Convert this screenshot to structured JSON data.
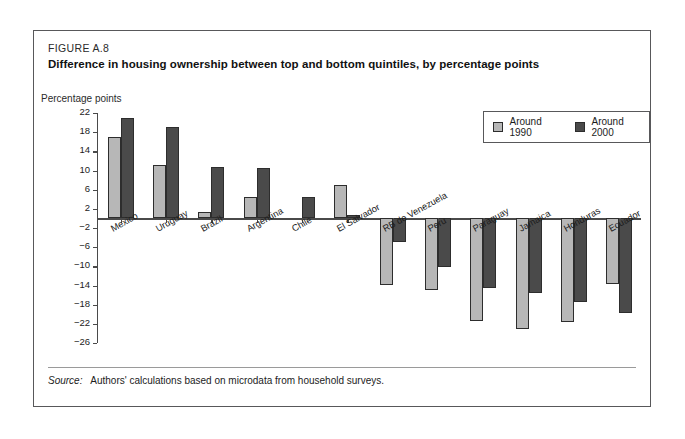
{
  "figure": {
    "number": "FIGURE A.8",
    "title": "Difference in housing ownership between top and bottom quintiles, by percentage points",
    "axis_title": "Percentage points",
    "source_label": "Source:",
    "source_text": "Authors' calculations based on microdata from household surveys."
  },
  "legend": {
    "position": "top-right",
    "items": [
      {
        "label": "Around 1990",
        "color": "#b7b7b7"
      },
      {
        "label": "Around 2000",
        "color": "#4a4a4a"
      }
    ]
  },
  "chart_data": {
    "type": "bar",
    "title": "Difference in housing ownership between top and bottom quintiles, by percentage points",
    "xlabel": "",
    "ylabel": "Percentage points",
    "ylim": [
      -26,
      22
    ],
    "ytick_step": 4,
    "yticks": [
      22,
      18,
      14,
      10,
      6,
      2,
      -2,
      -6,
      -10,
      -14,
      -18,
      -22,
      -26
    ],
    "ytick_labels": [
      "22",
      "18",
      "14",
      "10",
      "6",
      "2",
      "−2",
      "−6",
      "−10",
      "−14",
      "−18",
      "−22",
      "−26"
    ],
    "grid": false,
    "legend_position": "top-right",
    "categories": [
      "Mexico",
      "Uruguay",
      "Brazil",
      "Argentina",
      "Chile",
      "El Salvador",
      "RB de Venezuela",
      "Peru",
      "Paraguay",
      "Jamaica",
      "Honduras",
      "Ecuador"
    ],
    "series": [
      {
        "name": "Around 1990",
        "color": "#b7b7b7",
        "values": [
          17,
          11.2,
          1.3,
          4.4,
          null,
          6.9,
          -14,
          -15,
          -21.5,
          -23,
          -21.7,
          -13.7
        ]
      },
      {
        "name": "Around 2000",
        "color": "#4a4a4a",
        "values": [
          20.9,
          19,
          10.8,
          10.6,
          4.4,
          0.7,
          -5,
          -10.2,
          -14.5,
          -15.5,
          -17.5,
          -19.7
        ]
      }
    ]
  }
}
